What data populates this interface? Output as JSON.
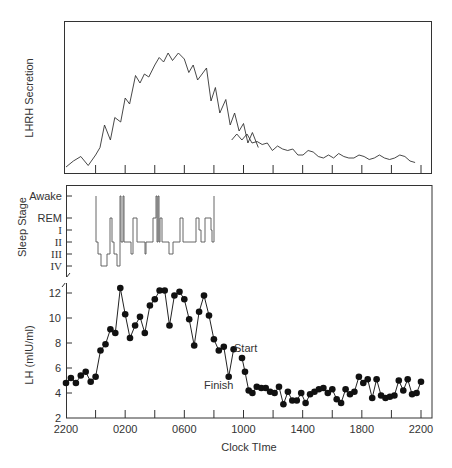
{
  "chart_data": [
    {
      "type": "line",
      "panel": "top",
      "title": "",
      "ylabel": "LHRH Secretion",
      "xlabel": "",
      "y_ticks_labeled": false,
      "note": "Relative units (no numeric y-axis). Values are relative 0-100 read from pixel heights; gap in trace near 0900.",
      "x_hours_from_2200": [
        0,
        0.5,
        1,
        1.5,
        2,
        2.3,
        2.6,
        3,
        3.3,
        3.7,
        4,
        4.3,
        4.7,
        5,
        5.3,
        5.6,
        6,
        6.3,
        6.6,
        6.9,
        7.2,
        7.6,
        8,
        8.3,
        8.6,
        8.9,
        9.2,
        9.5,
        9.8,
        10.1,
        10.4,
        10.8,
        11.1,
        11.4,
        11.7,
        12,
        12.3,
        12.6,
        13,
        13.3,
        13.6,
        13.9,
        14.2,
        14.6,
        15,
        15.3,
        15.6,
        16,
        16.3,
        16.6,
        17,
        17.3,
        17.6,
        18,
        18.3,
        18.6,
        19,
        19.3,
        19.6,
        20,
        20.3,
        20.6,
        21,
        21.3,
        21.6,
        22,
        22.3,
        22.6,
        23,
        23.3,
        23.6,
        24
      ],
      "relative_values": [
        2,
        6,
        9,
        3,
        10,
        15,
        30,
        20,
        35,
        32,
        48,
        44,
        63,
        58,
        64,
        62,
        70,
        75,
        72,
        78,
        73,
        78,
        74,
        65,
        70,
        60,
        64,
        68,
        46,
        55,
        38,
        47,
        30,
        38,
        26,
        31,
        18,
        25,
        15
      ],
      "series_break_after_index": 38,
      "relative_values_after_break": [
        20,
        24,
        20,
        24,
        18,
        19,
        17,
        18,
        13,
        16,
        14,
        13,
        14,
        10,
        10,
        13,
        12,
        9,
        8,
        10,
        8,
        11,
        9,
        8,
        8,
        10,
        9,
        7,
        8,
        10,
        8,
        7,
        8,
        10,
        9,
        6,
        5
      ],
      "x_tick_count": 13
    },
    {
      "type": "step",
      "panel": "middle",
      "ylabel": "Sleep Stage",
      "y_categories": [
        "Awake",
        "REM",
        "I",
        "II",
        "III",
        "IV"
      ],
      "note": "Hypnogram from approx 2330 to 0800; values approximate."
    },
    {
      "type": "line",
      "panel": "bottom",
      "ylabel": "LH (mIU/ml)",
      "xlabel": "Clock TIme",
      "x_tick_labels": [
        "2200",
        "0200",
        "0600",
        "1000",
        "1400",
        "1800",
        "2200"
      ],
      "y_ticks": [
        2,
        4,
        6,
        8,
        10,
        12
      ],
      "ylim": [
        2,
        13
      ],
      "axis_break": true,
      "annotations": [
        {
          "text": "Start",
          "near_hour": 11.7,
          "value": 6.8
        },
        {
          "text": "Finish",
          "near_hour": 10.5,
          "value": 5.3
        }
      ],
      "series": [
        {
          "name": "LH segment 1",
          "x_hours_from_2200": [
            0,
            0.33,
            0.67,
            1,
            1.33,
            1.67,
            2,
            2.33,
            2.67,
            3,
            3.33,
            3.67,
            4,
            4.33,
            4.67,
            5,
            5.33,
            5.67,
            6,
            6.33,
            6.67,
            7,
            7.33,
            7.67,
            8,
            8.33,
            8.67,
            9,
            9.33,
            9.67,
            10,
            10.33,
            10.67,
            11,
            11.33
          ],
          "values": [
            4.8,
            5.2,
            4.8,
            5.4,
            5.7,
            4.9,
            5.3,
            7.4,
            7.9,
            9.1,
            8.8,
            12.4,
            10.3,
            8.4,
            9.4,
            10.1,
            8.8,
            11.0,
            11.5,
            12.2,
            12.2,
            9.4,
            11.8,
            12.1,
            11.5,
            9.9,
            7.8,
            10.5,
            11.8,
            10.2,
            8.3,
            7.4,
            7.7,
            5.3,
            7.5
          ]
        },
        {
          "name": "LH segment 2",
          "x_hours_from_2200": [
            11.9,
            12.1,
            12.35,
            12.6,
            12.9,
            13.2,
            13.5,
            13.8,
            14.1,
            14.4,
            14.7,
            15,
            15.3,
            15.6,
            15.9,
            16.2,
            16.5,
            16.8,
            17.1,
            17.4,
            17.7,
            18,
            18.3,
            18.6,
            18.9,
            19.2,
            19.5,
            19.8,
            20.1,
            20.4,
            20.7,
            21,
            21.3,
            21.6,
            21.9,
            22.2,
            22.5,
            22.8,
            23.1,
            23.4,
            23.7,
            24
          ],
          "values": [
            6.8,
            5.7,
            4.2,
            4.0,
            4.5,
            4.4,
            4.4,
            4.1,
            4.0,
            4.5,
            3.1,
            4.1,
            3.4,
            3.4,
            4.0,
            3.2,
            3.9,
            4.1,
            4.3,
            4.4,
            4.0,
            4.3,
            3.5,
            3.2,
            4.3,
            3.9,
            4.1,
            5.3,
            4.8,
            5.1,
            3.6,
            5.1,
            3.8,
            3.6,
            3.7,
            3.8,
            5.0,
            4.2,
            5.1,
            3.9,
            4.0,
            4.9
          ]
        }
      ]
    }
  ],
  "labels": {
    "top_ylabel": "LHRH Secretion",
    "sleep_ylabel": "Sleep Stage",
    "lh_ylabel": "LH (mIU/ml)",
    "xlabel": "Clock TIme",
    "start": "Start",
    "finish": "Finish",
    "stages": [
      "Awake",
      "REM",
      "I",
      "II",
      "III",
      "IV"
    ],
    "x_ticks": [
      "2200",
      "0200",
      "0600",
      "1000",
      "1400",
      "1800",
      "2200"
    ],
    "y_ticks": [
      "2",
      "4",
      "6",
      "8",
      "10",
      "12"
    ]
  }
}
